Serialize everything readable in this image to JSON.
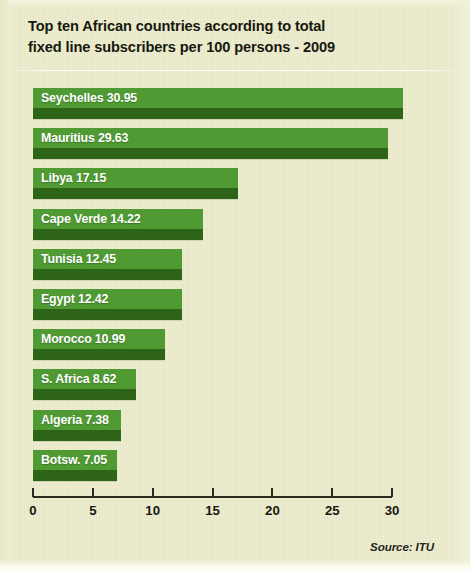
{
  "title": {
    "line1": "Top ten African countries according to total",
    "line2": "fixed line subscribers per 100 persons - 2009"
  },
  "source": "Source: ITU",
  "colors": {
    "background": "#ececcc",
    "bar_light": "#4f9a33",
    "bar_dark": "#2e6418",
    "bar_label": "#ffffff",
    "axis": "#2b2b20",
    "title": "#17180f"
  },
  "chart_data": {
    "type": "bar",
    "orientation": "horizontal",
    "title": "Top ten African countries according to total fixed line subscribers per 100 persons - 2009",
    "xlabel": "",
    "ylabel": "",
    "xlim": [
      0,
      30
    ],
    "xticks": [
      0,
      5,
      10,
      15,
      20,
      25,
      30
    ],
    "xtick_labels": [
      "0",
      "5",
      "10",
      "15",
      "20",
      "25",
      "30"
    ],
    "grid": false,
    "legend": false,
    "source": "Source: ITU",
    "categories": [
      "Seychelles",
      "Mauritius",
      "Libya",
      "Cape Verde",
      "Tunisia",
      "Egypt",
      "Morocco",
      "S. Africa",
      "Algeria",
      "Botsw."
    ],
    "values": [
      30.95,
      29.63,
      17.15,
      14.22,
      12.45,
      12.42,
      10.99,
      8.62,
      7.38,
      7.05
    ],
    "bars": [
      {
        "label": "Seychelles  30.95",
        "category": "Seychelles",
        "value": 30.95
      },
      {
        "label": "Mauritius 29.63",
        "category": "Mauritius",
        "value": 29.63
      },
      {
        "label": "Libya 17.15",
        "category": "Libya",
        "value": 17.15
      },
      {
        "label": "Cape Verde 14.22",
        "category": "Cape Verde",
        "value": 14.22
      },
      {
        "label": "Tunisia 12.45",
        "category": "Tunisia",
        "value": 12.45
      },
      {
        "label": "Egypt 12.42",
        "category": "Egypt",
        "value": 12.42
      },
      {
        "label": "Morocco 10.99",
        "category": "Morocco",
        "value": 10.99
      },
      {
        "label": "S. Africa 8.62",
        "category": "S. Africa",
        "value": 8.62
      },
      {
        "label": "Algeria 7.38",
        "category": "Algeria",
        "value": 7.38
      },
      {
        "label": "Botsw. 7.05",
        "category": "Botsw.",
        "value": 7.05
      }
    ]
  }
}
